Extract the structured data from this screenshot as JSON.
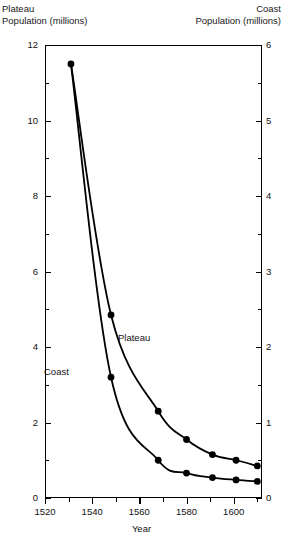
{
  "axis_titles": {
    "left_line1": "Plateau",
    "left_line2": "Population (millions)",
    "right_line1": "Coast",
    "right_line2": "Population (millions)",
    "x": "Year"
  },
  "chart_data": {
    "type": "line",
    "title": "",
    "xlabel": "Year",
    "ylabel": "Plateau Population (millions)",
    "y2label": "Coast Population (millions)",
    "xlim": [
      1520,
      1612
    ],
    "ylim": [
      0,
      12
    ],
    "y2lim": [
      0,
      6
    ],
    "grid": false,
    "legend": "inline-labels",
    "x_ticks_major": [
      1520,
      1540,
      1560,
      1580,
      1600
    ],
    "x_ticks_minor": [
      1530,
      1550,
      1570,
      1590,
      1610
    ],
    "y_ticks_major": [
      0,
      2,
      4,
      6,
      8,
      10,
      12
    ],
    "y_ticks_minor": [
      1,
      3,
      5,
      7,
      9,
      11
    ],
    "y2_ticks_major": [
      0,
      1,
      2,
      3,
      4,
      5,
      6
    ],
    "y2_ticks_minor": [
      0.5,
      1.5,
      2.5,
      3.5,
      4.5,
      5.5
    ],
    "series": [
      {
        "name": "Plateau",
        "axis": "left",
        "units": "millions",
        "marker": "filled-circle",
        "x": [
          1531,
          1548,
          1568,
          1580,
          1591,
          1601,
          1610
        ],
        "values": [
          11.5,
          4.85,
          2.3,
          1.55,
          1.15,
          1.0,
          0.85
        ]
      },
      {
        "name": "Coast",
        "axis": "right",
        "units": "millions",
        "marker": "filled-circle",
        "x": [
          1531,
          1548,
          1568,
          1580,
          1591,
          1601,
          1610
        ],
        "values": [
          5.75,
          1.6,
          0.5,
          0.33,
          0.27,
          0.24,
          0.22
        ]
      }
    ],
    "series_labels": [
      {
        "text": "Plateau",
        "x": 1560,
        "y": 3.9
      },
      {
        "text": "Coast",
        "x": 1520,
        "y": 3.0
      }
    ]
  }
}
